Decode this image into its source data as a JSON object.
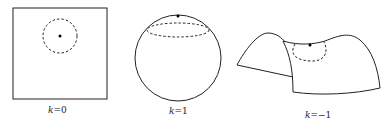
{
  "figures": [
    {
      "id": "flat",
      "label_var": "k",
      "label_eq": "=0",
      "label": "k=0"
    },
    {
      "id": "sphere",
      "label_var": "k",
      "label_eq": "=1",
      "label": "k=1"
    },
    {
      "id": "saddle",
      "label_var": "k",
      "label_eq": "=−1",
      "label": "k=−1"
    }
  ],
  "colors": {
    "stroke": "#222222",
    "background": "#ffffff"
  }
}
